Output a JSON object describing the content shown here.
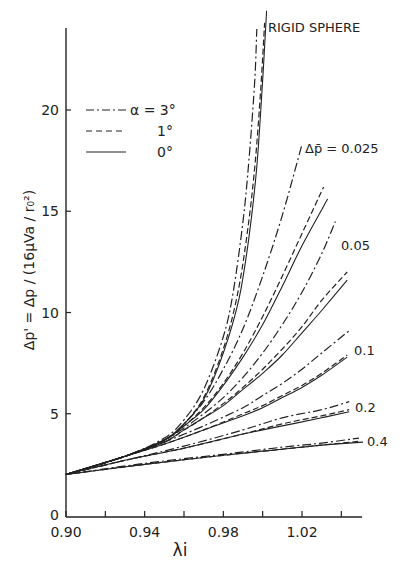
{
  "chart_data": {
    "type": "line",
    "title": "",
    "xlabel": "λi",
    "ylabel": "Δp' = Δp / (16μVa / r₀²)",
    "xlim": [
      0.9,
      1.05
    ],
    "ylim": [
      0,
      24
    ],
    "xticks": [
      0.9,
      0.92,
      0.94,
      0.96,
      0.98,
      1.0,
      1.02,
      1.04
    ],
    "xtick_labels": [
      "0.90",
      "",
      "0.94",
      "",
      "0.98",
      "",
      "1.02",
      ""
    ],
    "yticks": [
      0,
      5,
      10,
      15,
      20
    ],
    "ytick_labels": [
      "0",
      "5",
      "10",
      "15",
      "20"
    ],
    "grid": false,
    "legend": {
      "placement": "top-left",
      "entries": [
        {
          "label": "α = 3°",
          "style": "dash-dot"
        },
        {
          "label": "1°",
          "style": "dashed"
        },
        {
          "label": "0°",
          "style": "solid"
        }
      ]
    },
    "annotations": [
      {
        "text": "RIGID SPHERE",
        "x": 1.002,
        "y": 23.5
      },
      {
        "text": "Δp̄ = 0.025",
        "x": 1.022,
        "y": 18.3
      },
      {
        "text": "0.05",
        "x": 1.037,
        "y": 13.3
      },
      {
        "text": "0.1",
        "x": 1.045,
        "y": 8.3
      },
      {
        "text": "0.2",
        "x": 1.046,
        "y": 5.3
      },
      {
        "text": "0.4",
        "x": 1.053,
        "y": 3.6
      }
    ],
    "series": [
      {
        "name": "Rigid sphere, α=3°",
        "group": "rigid",
        "style": "dash-dot",
        "x": [
          0.9,
          0.93,
          0.95,
          0.96,
          0.97,
          0.98,
          0.985,
          0.99,
          0.993,
          0.996,
          0.997
        ],
        "y": [
          2.0,
          2.9,
          3.8,
          4.7,
          6.2,
          8.8,
          11.0,
          14.5,
          17.5,
          21.5,
          24.0
        ]
      },
      {
        "name": "Rigid sphere, α=1°",
        "group": "rigid",
        "style": "dashed",
        "x": [
          0.9,
          0.93,
          0.95,
          0.96,
          0.97,
          0.98,
          0.987,
          0.992,
          0.996,
          0.999,
          1.001
        ],
        "y": [
          2.0,
          2.9,
          3.7,
          4.5,
          5.8,
          8.2,
          10.8,
          13.8,
          17.2,
          21.0,
          24.3
        ]
      },
      {
        "name": "Rigid sphere, α=0°",
        "group": "rigid",
        "style": "solid",
        "x": [
          0.9,
          0.93,
          0.95,
          0.96,
          0.97,
          0.98,
          0.988,
          0.993,
          0.997,
          1.0,
          1.002
        ],
        "y": [
          2.0,
          2.9,
          3.7,
          4.5,
          5.7,
          8.0,
          10.7,
          13.7,
          17.2,
          21.5,
          24.9
        ]
      },
      {
        "name": "Δp̄=0.025, α=3°",
        "group": "0.025",
        "style": "dash-dot",
        "x": [
          0.9,
          0.93,
          0.95,
          0.96,
          0.97,
          0.98,
          0.99,
          1.0,
          1.01,
          1.02
        ],
        "y": [
          2.0,
          2.9,
          3.7,
          4.5,
          5.6,
          7.2,
          9.2,
          11.8,
          14.8,
          18.3
        ]
      },
      {
        "name": "Δp̄=0.025, α=1°",
        "group": "0.025",
        "style": "dashed",
        "x": [
          0.9,
          0.93,
          0.95,
          0.96,
          0.97,
          0.98,
          0.99,
          1.0,
          1.01,
          1.02,
          1.031
        ],
        "y": [
          2.0,
          2.9,
          3.7,
          4.4,
          5.3,
          6.5,
          8.0,
          9.8,
          11.8,
          13.9,
          16.2
        ]
      },
      {
        "name": "Δp̄=0.025, α=0°",
        "group": "0.025",
        "style": "solid",
        "x": [
          0.9,
          0.93,
          0.95,
          0.96,
          0.97,
          0.98,
          0.99,
          1.0,
          1.01,
          1.02,
          1.033
        ],
        "y": [
          2.0,
          2.9,
          3.7,
          4.4,
          5.2,
          6.4,
          7.8,
          9.4,
          11.3,
          13.3,
          15.6
        ]
      },
      {
        "name": "Δp̄=0.05, α=3°",
        "group": "0.05",
        "style": "dash-dot",
        "x": [
          0.9,
          0.93,
          0.95,
          0.96,
          0.97,
          0.98,
          0.99,
          1.0,
          1.01,
          1.02,
          1.03,
          1.037
        ],
        "y": [
          2.0,
          2.9,
          3.7,
          4.3,
          5.0,
          5.8,
          6.8,
          8.0,
          9.4,
          11.0,
          12.9,
          14.5
        ]
      },
      {
        "name": "Δp̄=0.05, α=1°",
        "group": "0.05",
        "style": "dashed",
        "x": [
          0.9,
          0.93,
          0.95,
          0.96,
          0.97,
          0.98,
          0.99,
          1.0,
          1.01,
          1.02,
          1.03,
          1.043
        ],
        "y": [
          2.0,
          2.9,
          3.6,
          4.2,
          4.8,
          5.5,
          6.3,
          7.2,
          8.2,
          9.3,
          10.6,
          12.0
        ]
      },
      {
        "name": "Δp̄=0.05, α=0°",
        "group": "0.05",
        "style": "solid",
        "x": [
          0.9,
          0.93,
          0.95,
          0.96,
          0.97,
          0.98,
          0.99,
          1.0,
          1.01,
          1.02,
          1.03,
          1.043
        ],
        "y": [
          2.0,
          2.9,
          3.6,
          4.2,
          4.8,
          5.4,
          6.2,
          7.0,
          7.9,
          9.0,
          10.1,
          11.6
        ]
      },
      {
        "name": "Δp̄=0.1, α=3°",
        "group": "0.1",
        "style": "dash-dot",
        "x": [
          0.9,
          0.93,
          0.95,
          0.97,
          0.99,
          1.0,
          1.01,
          1.02,
          1.03,
          1.044
        ],
        "y": [
          2.0,
          2.9,
          3.6,
          4.4,
          5.3,
          5.9,
          6.5,
          7.2,
          8.0,
          9.1
        ]
      },
      {
        "name": "Δp̄=0.1, α=1°",
        "group": "0.1",
        "style": "dashed",
        "x": [
          0.9,
          0.93,
          0.95,
          0.97,
          0.99,
          1.0,
          1.01,
          1.02,
          1.03,
          1.043
        ],
        "y": [
          2.0,
          2.9,
          3.5,
          4.2,
          5.0,
          5.4,
          5.9,
          6.4,
          7.0,
          7.9
        ]
      },
      {
        "name": "Δp̄=0.1, α=0°",
        "group": "0.1",
        "style": "solid",
        "x": [
          0.9,
          0.93,
          0.95,
          0.97,
          0.99,
          1.0,
          1.01,
          1.02,
          1.03,
          1.043
        ],
        "y": [
          2.0,
          2.9,
          3.5,
          4.2,
          4.9,
          5.3,
          5.8,
          6.3,
          6.9,
          7.8
        ]
      },
      {
        "name": "Δp̄=0.2, α=3°",
        "group": "0.2",
        "style": "dash-dot",
        "x": [
          0.9,
          0.93,
          0.96,
          0.99,
          1.01,
          1.03,
          1.044
        ],
        "y": [
          2.0,
          2.7,
          3.4,
          4.2,
          4.8,
          5.2,
          5.6
        ]
      },
      {
        "name": "Δp̄=0.2, α=1°",
        "group": "0.2",
        "style": "dashed",
        "x": [
          0.9,
          0.93,
          0.96,
          0.99,
          1.01,
          1.03,
          1.044
        ],
        "y": [
          2.0,
          2.7,
          3.3,
          4.0,
          4.5,
          4.9,
          5.2
        ]
      },
      {
        "name": "Δp̄=0.2, α=0°",
        "group": "0.2",
        "style": "solid",
        "x": [
          0.9,
          0.93,
          0.96,
          0.99,
          1.01,
          1.03,
          1.044
        ],
        "y": [
          2.0,
          2.7,
          3.3,
          4.0,
          4.4,
          4.8,
          5.1
        ]
      },
      {
        "name": "Δp̄=0.4, α=3°",
        "group": "0.4",
        "style": "dash-dot",
        "x": [
          0.9,
          0.94,
          0.98,
          1.01,
          1.03,
          1.049
        ],
        "y": [
          2.0,
          2.55,
          3.0,
          3.35,
          3.55,
          3.8
        ]
      },
      {
        "name": "Δp̄=0.4, α=1°",
        "group": "0.4",
        "style": "dashed",
        "x": [
          0.9,
          0.94,
          0.98,
          1.01,
          1.03,
          1.05
        ],
        "y": [
          2.0,
          2.5,
          2.95,
          3.25,
          3.45,
          3.65
        ]
      },
      {
        "name": "Δp̄=0.4, α=0°",
        "group": "0.4",
        "style": "solid",
        "x": [
          0.9,
          0.94,
          0.98,
          1.01,
          1.03,
          1.051
        ],
        "y": [
          2.0,
          2.5,
          2.95,
          3.25,
          3.45,
          3.6
        ]
      }
    ]
  }
}
